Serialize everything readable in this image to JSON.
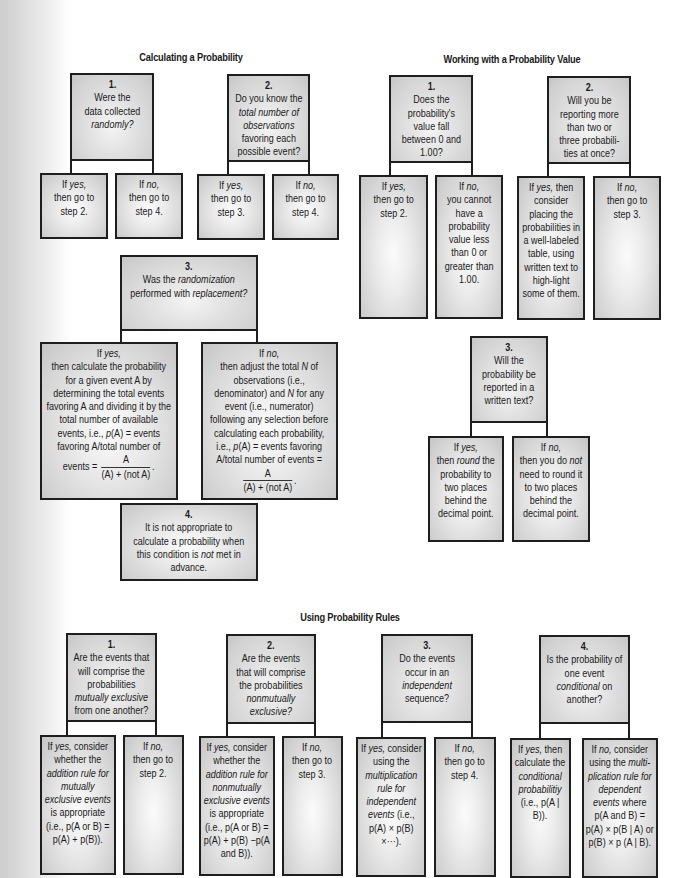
{
  "sections": {
    "calculating": {
      "title": "Calculating a Probability",
      "step1": {
        "num": "1.",
        "q_a": "Were the",
        "q_b": "data collected",
        "q_c": "randomly?",
        "yes_a": "If ",
        "yes_b": "yes,",
        "yes_c": "then go to",
        "yes_d": "step 2.",
        "no_a": "If ",
        "no_b": "no,",
        "no_c": "then go to",
        "no_d": "step 4."
      },
      "step2": {
        "num": "2.",
        "q_a": "Do you know the",
        "q_b": "total number of",
        "q_c": "observations",
        "q_d": "favoring each",
        "q_e": "possible event?",
        "yes_a": "If ",
        "yes_b": "yes,",
        "yes_c": "then go to",
        "yes_d": "step 3.",
        "no_a": "If ",
        "no_b": "no,",
        "no_c": "then go to",
        "no_d": "step 4."
      },
      "step3": {
        "num": "3.",
        "q_a": "Was the ",
        "q_b": "randomization",
        "q_c": "performed with ",
        "q_d": "replacement?",
        "yes_head_a": "If ",
        "yes_head_b": "yes,",
        "yes_body": "then calculate the probability for a given event A by determining the total events favoring A and dividing it by the total number of available events, i.e., ",
        "yes_p": "p",
        "yes_body2": "(A) = events favoring A/total number of events = ",
        "no_head_a": "If ",
        "no_head_b": "no,",
        "no_body_a": "then adjust the total ",
        "no_N1": "N",
        "no_body_b": " of observations (i.e., denominator) and ",
        "no_N2": "N",
        "no_body_c": " for any event (i.e., numerator) following any selection before calculating each probability, i.e., ",
        "no_p": "p",
        "no_body_d": "(A) = events favoring A/total number of events = ",
        "frac_num": "A",
        "frac_den": "(A) + (not A)",
        "frac_tail": "."
      },
      "step4": {
        "num": "4.",
        "text_a": "It is not appropriate to calculate a probability when this condition is ",
        "text_b": "not",
        "text_c": " met in advance."
      }
    },
    "working": {
      "title": "Working with a Probability Value",
      "step1": {
        "num": "1.",
        "q_a": "Does the",
        "q_b": "probability's",
        "q_c": "value fall",
        "q_d": "between 0 and",
        "q_e": "1.00?",
        "yes_a": "If ",
        "yes_b": "yes,",
        "yes_c": "then go to",
        "yes_d": "step 2.",
        "no_a": "If ",
        "no_b": "no,",
        "no_c": "you cannot have a probability value less than 0 or greater than 1.00."
      },
      "step2": {
        "num": "2.",
        "q_a": "Will you be",
        "q_b": "reporting more",
        "q_c": "than two or",
        "q_d": "three probabili-",
        "q_e": "ties at once?",
        "yes_a": "If ",
        "yes_b": "yes,",
        "yes_c": " then consider placing the probabilities in a well-labeled table, using written text to high-light some of them.",
        "no_a": "If ",
        "no_b": "no,",
        "no_c": "then go to",
        "no_d": "step 3."
      },
      "step3": {
        "num": "3.",
        "q_a": "Will the",
        "q_b": "probability be",
        "q_c": "reported in a",
        "q_d": "written text?",
        "yes_a": "If ",
        "yes_b": "yes,",
        "yes_c": "then ",
        "yes_d": "round",
        "yes_e": " the probability to two places behind the decimal point.",
        "no_a": "If ",
        "no_b": "no,",
        "no_c": "then you do ",
        "no_d": "not",
        "no_e": " need to round it to two places behind the decimal point."
      }
    },
    "rules": {
      "title": "Using Probability Rules",
      "step1": {
        "num": "1.",
        "q_a": "Are the events that will comprise the probabilities ",
        "q_b": "mutually exclusive",
        "q_c": " from one another?",
        "yes_a": "If ",
        "yes_b": "yes,",
        "yes_c": " consider whether the ",
        "yes_d": "addition rule for mutually exclusive events",
        "yes_e": " is appropriate (i.e., ",
        "yes_f": "p(A or B) = p(A) + p(B)).",
        "no_a": "If ",
        "no_b": "no,",
        "no_c": "then go to",
        "no_d": "step 2."
      },
      "step2": {
        "num": "2.",
        "q_a": "Are the events that will comprise the probabilities ",
        "q_b": "nonmutually exclusive?",
        "yes_a": "If ",
        "yes_b": "yes,",
        "yes_c": " consider whether the ",
        "yes_d": "addition rule for nonmutually exclusive events",
        "yes_e": " is appropriate (i.e., ",
        "yes_f": "p(A or B) = p(A) + p(B) −p(A and B)).",
        "no_a": "If ",
        "no_b": "no,",
        "no_c": "then go to",
        "no_d": "step 3."
      },
      "step3": {
        "num": "3.",
        "q_a": "Do the events occur in an ",
        "q_b": "independent",
        "q_c": " sequence?",
        "yes_a": "If ",
        "yes_b": "yes,",
        "yes_c": " consider using the ",
        "yes_d": "multiplication rule for independent events",
        "yes_e": " (i.e., p(A) × p(B) ×···).",
        "no_a": "If ",
        "no_b": "no,",
        "no_c": "then go to",
        "no_d": "step 4."
      },
      "step4": {
        "num": "4.",
        "q_a": "Is the probability of one event ",
        "q_b": "conditional",
        "q_c": " on another?",
        "yes_a": "If ",
        "yes_b": "yes,",
        "yes_c": " then calculate the ",
        "yes_d": "conditional probabilitiy",
        "yes_e": " (i.e., p(A | B)).",
        "no_a": "If ",
        "no_b": "no,",
        "no_c": " consider using the ",
        "no_d": "multi-plication rule for dependent events",
        "no_e": " where p(A and B) = p(A) × p(B | A) or p(B) × p (A | B)."
      }
    }
  }
}
